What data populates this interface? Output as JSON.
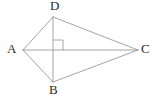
{
  "figure": {
    "kind": "geometry-diagram",
    "background_color": "#ffffff",
    "line_color": "#9a9a9a",
    "line_width": 0.9,
    "label_color": "#2b2b2b",
    "label_font_size": 13,
    "width": 160,
    "height": 100
  },
  "points": {
    "A": {
      "label": "A",
      "x": 23,
      "y": 50
    },
    "B": {
      "label": "B",
      "x": 53,
      "y": 82
    },
    "C": {
      "label": "C",
      "x": 138,
      "y": 50
    },
    "D": {
      "label": "D",
      "x": 53,
      "y": 17
    }
  },
  "segments": [
    {
      "name": "AD",
      "from": "A",
      "to": "D"
    },
    {
      "name": "AB",
      "from": "A",
      "to": "B"
    },
    {
      "name": "DC",
      "from": "D",
      "to": "C"
    },
    {
      "name": "BC",
      "from": "B",
      "to": "C"
    },
    {
      "name": "AC",
      "from": "A",
      "to": "C"
    },
    {
      "name": "DB",
      "from": "D",
      "to": "B"
    }
  ],
  "right_angle": {
    "name": "right-angle-at-intersection",
    "vertex_x": 53,
    "vertex_y": 50,
    "size": 10,
    "direction_x": 1,
    "direction_y": -1,
    "marker": "square"
  },
  "chart_data": {
    "type": "diagram",
    "title": "",
    "annotations": [
      "A",
      "B",
      "C",
      "D"
    ]
  }
}
